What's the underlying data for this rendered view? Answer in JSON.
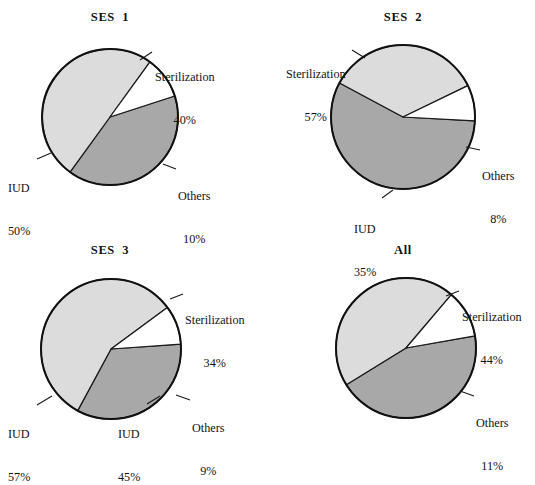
{
  "figure": {
    "width": 535,
    "height": 446,
    "background": "#ffffff"
  },
  "colors": {
    "sterilization": "#a8a8a8",
    "iud": "#dcdcdc",
    "others": "#ffffff",
    "outline": "#111111",
    "text": "#131313"
  },
  "chart_data": {
    "type": "pie",
    "title": "",
    "charts": [
      {
        "id": "ses-1",
        "title": "SES  1",
        "categories": [
          "Sterilization",
          "IUD",
          "Others"
        ],
        "values": [
          40,
          50,
          10
        ],
        "labels": [
          "40%",
          "50%",
          "10%"
        ],
        "start_angle_deg": -18,
        "direction": "clockwise",
        "center": [
          110,
          117
        ],
        "radius": 68
      },
      {
        "id": "ses-2",
        "title": "SES  2",
        "categories": [
          "Sterilization",
          "IUD",
          "Others"
        ],
        "values": [
          57,
          35,
          8
        ],
        "labels": [
          "57%",
          "35%",
          "8%"
        ],
        "start_angle_deg": 3,
        "direction": "clockwise",
        "center": [
          403,
          117
        ],
        "radius": 72
      },
      {
        "id": "ses-3",
        "title": "SES  3",
        "categories": [
          "Sterilization",
          "IUD",
          "Others"
        ],
        "values": [
          34,
          57,
          9
        ],
        "labels": [
          "34%",
          "57%",
          "9%"
        ],
        "start_angle_deg": -4,
        "direction": "clockwise",
        "center": [
          111,
          349
        ],
        "radius": 70
      },
      {
        "id": "all",
        "title": "All",
        "categories": [
          "Sterilization",
          "IUD",
          "Others"
        ],
        "values": [
          44,
          45,
          11
        ],
        "labels": [
          "44%",
          "45%",
          "11%"
        ],
        "start_angle_deg": -10,
        "direction": "clockwise",
        "center": [
          406,
          348
        ],
        "radius": 70
      }
    ],
    "legend_position": "none",
    "grid": false
  },
  "panels": {
    "ses1": {
      "title": "SES  1",
      "title_pos": [
        62,
        10,
        96
      ],
      "sterilization": {
        "name": "Sterilization",
        "pct": "40%",
        "pos": [
          155,
          41
        ],
        "align": "left",
        "leader": [
          [
            152,
            52
          ],
          [
            140,
            60
          ]
        ]
      },
      "iud": {
        "name": "IUD",
        "pct": "50%",
        "pos": [
          8,
          152
        ],
        "align": "left",
        "leader": [
          [
            37,
            159
          ],
          [
            51,
            153
          ]
        ]
      },
      "others": {
        "name": "Others",
        "pct": "10%",
        "pos": [
          178,
          160
        ],
        "align": "left",
        "leader": [
          [
            176,
            169
          ],
          [
            163,
            164
          ]
        ]
      }
    },
    "ses2": {
      "title": "SES  2",
      "title_pos": [
        355,
        10,
        96
      ],
      "sterilization": {
        "name": "Sterilization",
        "pct": "57%",
        "pos": [
          286,
          38
        ],
        "align": "left",
        "leader": [
          [
            352,
            50
          ],
          [
            365,
            58
          ]
        ]
      },
      "iud": {
        "name": "IUD",
        "pct": "35%",
        "pos": [
          354,
          193
        ],
        "align": "left",
        "leader": [
          [
            382,
            198
          ],
          [
            393,
            190
          ]
        ]
      },
      "others": {
        "name": "Others",
        "pct": "8%",
        "pos": [
          482,
          140
        ],
        "align": "left",
        "leader": [
          [
            480,
            150
          ],
          [
            466,
            147
          ]
        ]
      }
    },
    "ses3": {
      "title": "SES  3",
      "title_pos": [
        62,
        243,
        96
      ],
      "sterilization": {
        "name": "Sterilization",
        "pct": "34%",
        "pos": [
          185,
          284
        ],
        "align": "left",
        "leader": [
          [
            183,
            294
          ],
          [
            170,
            299
          ]
        ]
      },
      "iud": {
        "name": "IUD",
        "pct": "57%",
        "pos": [
          8,
          398
        ],
        "align": "left",
        "leader": [
          [
            37,
            405
          ],
          [
            52,
            396
          ]
        ]
      },
      "others": {
        "name": "Others",
        "pct": "9%",
        "pos": [
          192,
          392
        ],
        "align": "left",
        "leader": [
          [
            190,
            400
          ],
          [
            176,
            395
          ]
        ]
      }
    },
    "all": {
      "title": "All",
      "title_pos": [
        355,
        243,
        96
      ],
      "sterilization": {
        "name": "Sterilization",
        "pct": "44%",
        "pos": [
          462,
          281
        ],
        "align": "left",
        "leader": [
          [
            459,
            291
          ],
          [
            446,
            296
          ]
        ]
      },
      "iud": {
        "name": "IUD",
        "pct": "45%",
        "pos": [
          118,
          398
        ],
        "align": "left",
        "leader": [
          [
            147,
            404
          ],
          [
            160,
            396
          ]
        ]
      },
      "others": {
        "name": "Others",
        "pct": "11%",
        "pos": [
          476,
          387
        ],
        "align": "left",
        "leader": [
          [
            474,
            396
          ],
          [
            460,
            391
          ]
        ]
      }
    }
  }
}
